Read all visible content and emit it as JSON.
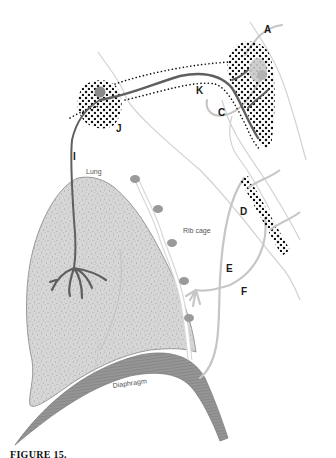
{
  "figure": {
    "labels": {
      "A": "A",
      "C": "C",
      "D": "D",
      "E": "E",
      "F": "F",
      "I": "I",
      "J": "J",
      "K": "K"
    },
    "structures": {
      "lung": "Lung",
      "rib_cage": "Rib cage",
      "diaphragm": "Diaphragm"
    },
    "caption": "FIGURE 15.",
    "colors": {
      "background": "#ffffff",
      "lung_fill": "#d4d4d4",
      "lung_outline": "#9a9a9a",
      "diaphragm_fill": "#8e8e8e",
      "nerve_dark": "#5a5a5a",
      "nerve_light": "#c4c4c4",
      "ganglion_dots": "#111111",
      "outline_light": "#cfcfcf",
      "ganglion_body": "#888888"
    }
  }
}
